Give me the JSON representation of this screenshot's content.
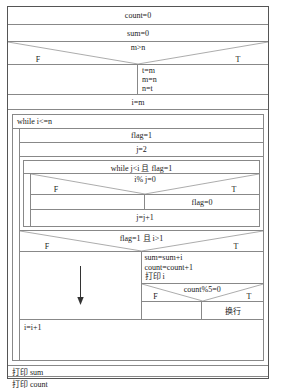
{
  "diagram": {
    "type": "nassi-shneiderman-flowchart",
    "title": "",
    "nodes": {
      "init_count": "count=0",
      "init_sum": "sum=0",
      "cond_swap": "m>n",
      "swap_false_label": "F",
      "swap_true_label": "T",
      "swap_false_body": "",
      "swap_true_line1": "t=m",
      "swap_true_line2": "m=n",
      "swap_true_line3": "n=t",
      "assign_i_m": "i=m",
      "while_outer": "while i<=n",
      "set_flag_1": "flag=1",
      "set_j_2": "j=2",
      "while_inner": "while j<i 且 flag=1",
      "cond_mod": "i% j=0",
      "mod_false_label": "F",
      "mod_true_label": "T",
      "mod_false_body": "",
      "mod_true_body": "flag=0",
      "inc_j": "j=j+1",
      "cond_prime": "flag=1 且 i>1",
      "prime_false_label": "F",
      "prime_true_label": "T",
      "prime_false_body": "",
      "prime_true_line1": "sum=sum+i",
      "prime_true_line2": "count=count+1",
      "prime_true_line3": "打印 i",
      "cond_newline": "count%5=0",
      "newline_false_label": "F",
      "newline_true_label": "T",
      "newline_false_body": "",
      "newline_true_body": "换行",
      "inc_i": "i=i+1",
      "print_sum": "打印 sum",
      "print_count": "打印 count"
    },
    "colors": {
      "outer_border": "#555555",
      "inner_line": "#888888",
      "text": "#1a1a1a",
      "background": "#ffffff"
    }
  }
}
